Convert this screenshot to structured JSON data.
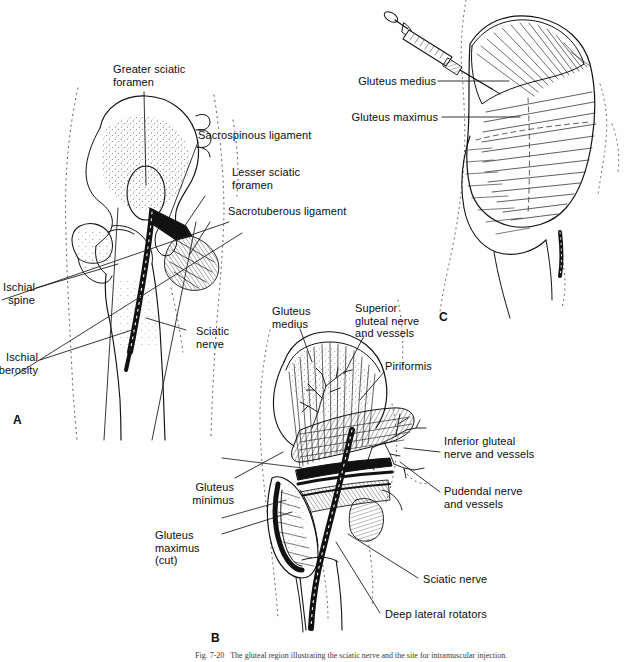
{
  "figure": {
    "caption": "Fig. 7-20   The gluteal region illustrating the sciatic nerve and the site for intramuscular injection.",
    "background_color": "#ffffff",
    "ink_color": "#111111"
  },
  "panels": [
    {
      "id": "A",
      "letter": "A",
      "description": "Posterior view of hip bone and proximal femur showing sciatic foramina, sacrospinous and sacrotuberous ligaments and the sciatic nerve",
      "labels": [
        {
          "name": "greater-sciatic-foramen",
          "text": "Greater sciatic\nforamen"
        },
        {
          "name": "sacrospinous-ligament",
          "text": "Sacrospinous ligament"
        },
        {
          "name": "lesser-sciatic-foramen",
          "text": "Lesser sciatic\nforamen"
        },
        {
          "name": "sacrotuberous-ligament",
          "text": "Sacrotuberous ligament"
        },
        {
          "name": "ischial-spine",
          "text": "Ischial\nspine"
        },
        {
          "name": "ischial-tuberosity",
          "text": "Ischial\ntuberosity"
        },
        {
          "name": "sciatic-nerve",
          "text": "Sciatic\nnerve"
        }
      ]
    },
    {
      "id": "B",
      "letter": "B",
      "description": "Deep dissection of the gluteal region with gluteus maximus cut, exposing piriformis, deep lateral rotators and neurovascular bundles",
      "labels": [
        {
          "name": "gluteus-medius",
          "text": "Gluteus\nmedius"
        },
        {
          "name": "superior-gluteal-nerve-and-vessels",
          "text": "Superior\ngluteal nerve\nand vessels"
        },
        {
          "name": "piriformis",
          "text": "Piriformis"
        },
        {
          "name": "inferior-gluteal-nerve-and-vessels",
          "text": "Inferior gluteal\nnerve and vessels"
        },
        {
          "name": "pudendal-nerve-and-vessels",
          "text": "Pudendal nerve\nand vessels"
        },
        {
          "name": "gluteus-minimus",
          "text": "Gluteus\nminimus"
        },
        {
          "name": "gluteus-maximus-cut",
          "text": "Gluteus\nmaximus\n(cut)"
        },
        {
          "name": "sciatic-nerve",
          "text": "Sciatic nerve"
        },
        {
          "name": "deep-lateral-rotators",
          "text": "Deep lateral rotators"
        }
      ]
    },
    {
      "id": "C",
      "letter": "C",
      "description": "Surface view of the gluteal region with a syringe demonstrating the safe upper outer quadrant injection site",
      "labels": [
        {
          "name": "gluteus-medius",
          "text": "Gluteus medius"
        },
        {
          "name": "gluteus-maximus",
          "text": "Gluteus maximus"
        }
      ],
      "instrument": {
        "name": "syringe",
        "text": "syringe"
      }
    }
  ]
}
